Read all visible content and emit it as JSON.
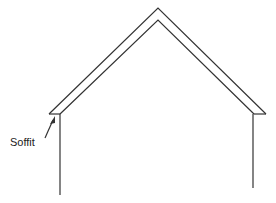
{
  "diagram": {
    "labels": {
      "soffit": "Soffit"
    },
    "colors": {
      "line": "#333333",
      "background": "#ffffff"
    }
  }
}
